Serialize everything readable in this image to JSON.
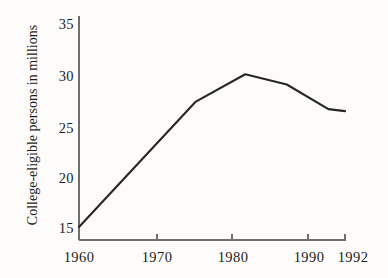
{
  "chart_data": {
    "type": "line",
    "title": "",
    "subtitle": "",
    "xlabel": "",
    "ylabel": "College-eligible persons in millions",
    "xlim": [
      1960,
      1992
    ],
    "ylim": [
      13.8,
      35
    ],
    "grid": false,
    "legend": null,
    "x_ticks": [
      1960,
      1970,
      1980,
      1990,
      1992
    ],
    "x_tick_labels": [
      "1960",
      "1970",
      "1980",
      "1990",
      "1992"
    ],
    "y_ticks": [
      15,
      20,
      25,
      30,
      35
    ],
    "y_tick_labels": [
      "15",
      "20",
      "25",
      "30",
      "35"
    ],
    "series": [
      {
        "name": "College-eligible persons",
        "color": "#272727",
        "x": [
          1960,
          1974,
          1980,
          1985,
          1990,
          1992
        ],
        "values": [
          15.1,
          27.3,
          30.0,
          29.0,
          26.6,
          26.4
        ]
      }
    ],
    "annotations": []
  },
  "axis": {
    "y_title": "College-eligible persons in millions"
  }
}
